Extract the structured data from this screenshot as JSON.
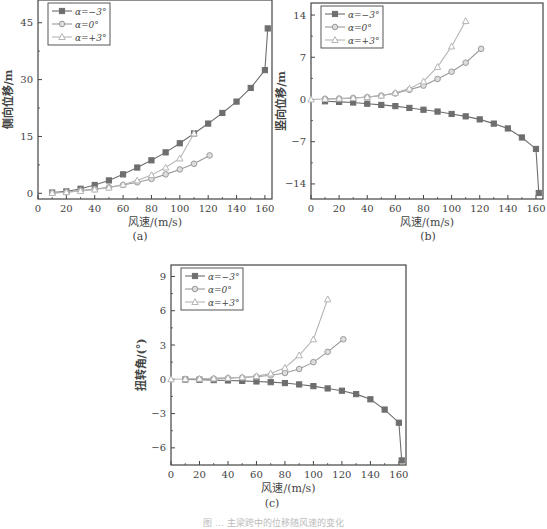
{
  "figure": {
    "caption_partial": "图 … 主梁跨中的位移随风速的变化",
    "captions": [
      "(a)",
      "(b)",
      "(c)"
    ]
  },
  "colors": {
    "axis": "#444444",
    "series_neg3": "#6e6e6e",
    "series_0": "#9a9a9a",
    "series_pos3": "#b5b5b5"
  },
  "chart_data": [
    {
      "id": "a",
      "type": "line",
      "title": "",
      "xlabel": "风速/(m/s)",
      "ylabel": "侧向位移/m",
      "xlim": [
        0,
        165
      ],
      "ylim": [
        -1.5,
        51
      ],
      "xticks": [
        0,
        20,
        40,
        60,
        80,
        100,
        120,
        140,
        160
      ],
      "yticks": [
        0,
        15,
        30,
        45
      ],
      "grid": false,
      "legend_position": "upper-left",
      "series": [
        {
          "name": "α=−3°",
          "marker": "square-filled",
          "x": [
            10,
            20,
            30,
            40,
            50,
            60,
            70,
            80,
            90,
            100,
            110,
            120,
            130,
            140,
            150,
            160,
            162
          ],
          "y": [
            0.2,
            0.5,
            1.2,
            2.2,
            3.4,
            5.0,
            6.8,
            8.7,
            10.8,
            13.2,
            15.8,
            18.4,
            21.2,
            24.2,
            27.8,
            32.5,
            43.5
          ]
        },
        {
          "name": "α=0°",
          "marker": "circle",
          "x": [
            10,
            20,
            30,
            40,
            50,
            60,
            70,
            80,
            90,
            100,
            110,
            121
          ],
          "y": [
            0.1,
            0.3,
            0.7,
            1.1,
            1.6,
            2.2,
            2.9,
            3.8,
            5.0,
            6.3,
            7.8,
            10.0
          ]
        },
        {
          "name": "α=+3°",
          "marker": "triangle-open",
          "x": [
            10,
            20,
            30,
            40,
            50,
            60,
            70,
            80,
            90,
            100,
            110
          ],
          "y": [
            0.1,
            0.3,
            0.6,
            1.0,
            1.5,
            2.3,
            3.4,
            4.8,
            6.8,
            9.2,
            15.8
          ]
        }
      ]
    },
    {
      "id": "b",
      "type": "line",
      "title": "",
      "xlabel": "风速/(m/s)",
      "ylabel": "竖向位移/m",
      "xlim": [
        0,
        165
      ],
      "ylim": [
        -16.5,
        16
      ],
      "xticks": [
        0,
        20,
        40,
        60,
        80,
        100,
        120,
        140,
        160
      ],
      "yticks": [
        -14,
        -7,
        0,
        7,
        14
      ],
      "grid": false,
      "legend_position": "upper-left",
      "series": [
        {
          "name": "α=−3°",
          "marker": "square-filled",
          "x": [
            10,
            20,
            30,
            40,
            50,
            60,
            70,
            80,
            90,
            100,
            110,
            120,
            130,
            140,
            150,
            160,
            162
          ],
          "y": [
            -0.3,
            -0.4,
            -0.5,
            -0.7,
            -0.9,
            -1.1,
            -1.4,
            -1.7,
            -2.0,
            -2.4,
            -2.8,
            -3.3,
            -4.0,
            -4.8,
            -6.3,
            -8.2,
            -15.5
          ]
        },
        {
          "name": "α=0°",
          "marker": "circle",
          "x": [
            10,
            20,
            30,
            40,
            50,
            60,
            70,
            80,
            90,
            100,
            110,
            121
          ],
          "y": [
            0.1,
            0.15,
            0.25,
            0.4,
            0.65,
            1.0,
            1.6,
            2.3,
            3.4,
            4.6,
            6.1,
            8.4
          ]
        },
        {
          "name": "α=+3°",
          "marker": "triangle-open",
          "x": [
            0,
            10,
            20,
            30,
            40,
            50,
            60,
            70,
            80,
            90,
            100,
            110
          ],
          "y": [
            0,
            0.1,
            0.15,
            0.25,
            0.4,
            0.65,
            1.1,
            1.8,
            3.0,
            5.4,
            8.8,
            13.0
          ]
        }
      ]
    },
    {
      "id": "c",
      "type": "line",
      "title": "",
      "xlabel": "风速/(m/s)",
      "ylabel": "扭转角/(°)",
      "xlim": [
        0,
        165
      ],
      "ylim": [
        -7.5,
        10
      ],
      "xticks": [
        0,
        20,
        40,
        60,
        80,
        100,
        120,
        140,
        160
      ],
      "yticks": [
        -6,
        -3,
        0,
        3,
        6,
        9
      ],
      "grid": false,
      "legend_position": "upper-left",
      "series": [
        {
          "name": "α=−3°",
          "marker": "square-filled",
          "x": [
            10,
            20,
            30,
            40,
            50,
            60,
            70,
            80,
            90,
            100,
            110,
            120,
            130,
            140,
            150,
            160,
            162
          ],
          "y": [
            -0.02,
            -0.04,
            -0.07,
            -0.1,
            -0.14,
            -0.19,
            -0.25,
            -0.33,
            -0.45,
            -0.6,
            -0.8,
            -1.0,
            -1.3,
            -1.75,
            -2.65,
            -3.8,
            -7.1
          ]
        },
        {
          "name": "α=0°",
          "marker": "circle",
          "x": [
            10,
            20,
            30,
            40,
            50,
            60,
            70,
            80,
            90,
            100,
            110,
            121
          ],
          "y": [
            0.01,
            0.03,
            0.06,
            0.1,
            0.15,
            0.22,
            0.35,
            0.55,
            0.9,
            1.5,
            2.4,
            3.5
          ]
        },
        {
          "name": "α=+3°",
          "marker": "triangle-open",
          "x": [
            0,
            10,
            20,
            30,
            40,
            50,
            60,
            70,
            80,
            90,
            100,
            110
          ],
          "y": [
            0,
            0.02,
            0.05,
            0.08,
            0.12,
            0.18,
            0.28,
            0.5,
            1.0,
            2.1,
            3.5,
            7.0
          ]
        }
      ]
    }
  ],
  "layout": {
    "panels": [
      {
        "id": "a",
        "left": 38,
        "top": 0,
        "right": 272,
        "bottom": 199
      },
      {
        "id": "b",
        "left": 311,
        "top": 3,
        "right": 543,
        "bottom": 199
      },
      {
        "id": "c",
        "left": 171,
        "top": 265,
        "right": 406,
        "bottom": 465
      }
    ]
  }
}
